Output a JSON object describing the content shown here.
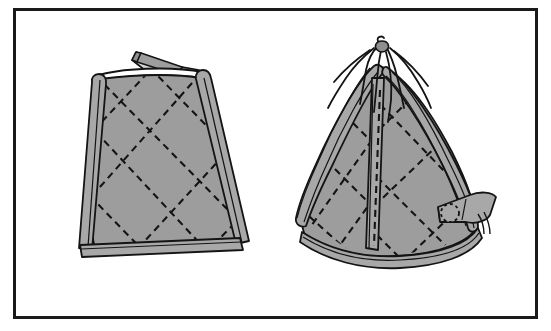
{
  "document": {
    "kind": "technical-line-illustration",
    "title": "Quilted tapered bag cover - two views",
    "background_color": "#ffffff",
    "caption": ""
  },
  "frame": {
    "name": "illustration-border",
    "x": 13,
    "y": 8,
    "width": 524,
    "height": 310,
    "stroke_color": "#1a1a1a",
    "stroke_width": 3,
    "fill_color": "#ffffff"
  },
  "palette": {
    "ink": "#141414",
    "panel_fill": "#9d9d9d",
    "binding_fill": "#a8a8a8",
    "binding_shadow": "#7e7e7e",
    "highlight": "#d8d8d8",
    "paper": "#ffffff"
  },
  "figures": [
    {
      "id": "figure-left",
      "label": "open-flat-top-view",
      "description": "Tapered quilted cover shown with the top opening flat and an open flap leaning to the upper left, piped binding down both side edges and across the bottom hem.",
      "parts": [
        {
          "name": "body-panel",
          "fill": "#9d9d9d",
          "stroke": "#141414"
        },
        {
          "name": "left-edge-binding",
          "fill": "#a8a8a8",
          "stroke": "#141414"
        },
        {
          "name": "right-edge-binding",
          "fill": "#a8a8a8",
          "stroke": "#141414"
        },
        {
          "name": "bottom-hem-binding",
          "fill": "#a8a8a8",
          "stroke": "#141414"
        },
        {
          "name": "top-rim-opening",
          "fill": "#ffffff",
          "stroke": "#141414"
        },
        {
          "name": "open-flap",
          "fill": "#9d9d9d",
          "stroke": "#141414"
        },
        {
          "name": "quilting-stitch-lines",
          "style": "dashed",
          "stroke": "#141414"
        }
      ],
      "quilting": {
        "pattern": "diagonal-crosshatch",
        "line_style": "dashed",
        "dash": "7 5"
      }
    },
    {
      "id": "figure-right",
      "label": "closed-drawstring-view",
      "description": "Same cover gathered closed at the top by a drawstring, with radiating gather folds, a curved bottom hem, a vertical centre seam binding and a side strap tab fastened with a round grommet button.",
      "parts": [
        {
          "name": "body-panel",
          "fill": "#9d9d9d",
          "stroke": "#141414"
        },
        {
          "name": "left-edge-binding",
          "fill": "#a8a8a8",
          "stroke": "#141414"
        },
        {
          "name": "centre-seam-binding",
          "fill": "#a8a8a8",
          "stroke": "#141414"
        },
        {
          "name": "right-edge-binding",
          "fill": "#a8a8a8",
          "stroke": "#141414"
        },
        {
          "name": "bottom-hem-binding",
          "fill": "#a8a8a8",
          "stroke": "#141414"
        },
        {
          "name": "drawstring-gather-top",
          "stroke": "#141414"
        },
        {
          "name": "drawstring-tail",
          "stroke": "#141414"
        },
        {
          "name": "strap-tab",
          "fill": "#a8a8a8",
          "stroke": "#141414"
        },
        {
          "name": "grommet-button",
          "fill": "#a8a8a8",
          "stroke": "#141414",
          "style": "dashed-circle"
        },
        {
          "name": "quilting-stitch-lines",
          "style": "dashed",
          "stroke": "#141414"
        }
      ],
      "quilting": {
        "pattern": "diagonal-crosshatch",
        "line_style": "dashed",
        "dash": "7 5"
      }
    }
  ]
}
